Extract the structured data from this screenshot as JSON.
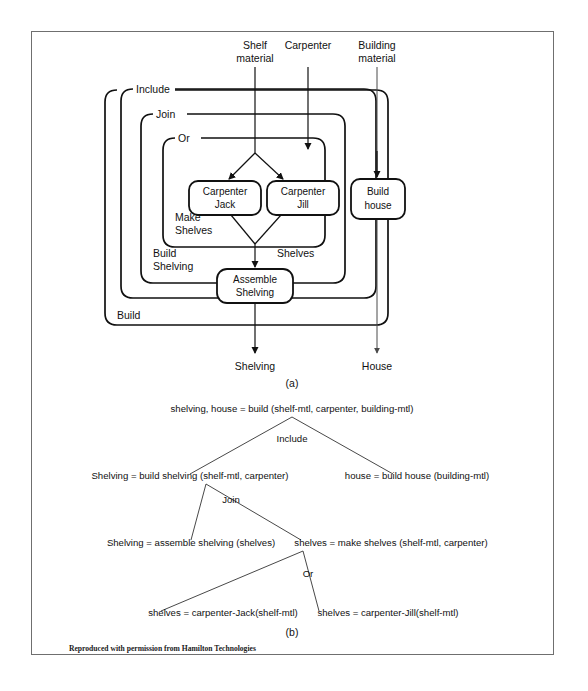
{
  "figure": {
    "credit": "Reproduced with permission from Hamilton Technologies",
    "part_a_caption": "(a)",
    "part_b_caption": "(b)"
  },
  "diagram_a": {
    "title": "FMap control structure decomposition",
    "inputs": [
      {
        "id": "shelf-material",
        "label_line1": "Shelf",
        "label_line2": "material"
      },
      {
        "id": "carpenter",
        "label_line1": "Carpenter",
        "label_line2": ""
      },
      {
        "id": "building-material",
        "label_line1": "Building",
        "label_line2": "material"
      }
    ],
    "containers": [
      {
        "id": "build",
        "label": "Build",
        "label_pos": "bottom-left"
      },
      {
        "id": "include",
        "label": "Include",
        "label_pos": "top-left"
      },
      {
        "id": "build-shelving",
        "label_line1": "Build",
        "label_line2": "Shelving",
        "label_pos": "bottom-left"
      },
      {
        "id": "join",
        "label": "Join",
        "label_pos": "top-left"
      },
      {
        "id": "make-shelves",
        "label_line1": "Make",
        "label_line2": "Shelves",
        "label_pos": "bottom-left"
      },
      {
        "id": "or",
        "label": "Or",
        "label_pos": "top-left"
      }
    ],
    "boxes": [
      {
        "id": "carpenter-jack",
        "line1": "Carpenter",
        "line2": "Jack"
      },
      {
        "id": "carpenter-jill",
        "line1": "Carpenter",
        "line2": "Jill"
      },
      {
        "id": "assemble-shelving",
        "line1": "Assemble",
        "line2": "Shelving"
      },
      {
        "id": "build-house",
        "line1": "Build",
        "line2": "house"
      }
    ],
    "intermediate_labels": [
      {
        "id": "shelves",
        "label": "Shelves"
      }
    ],
    "outputs": [
      {
        "id": "shelving",
        "label": "Shelving"
      },
      {
        "id": "house",
        "label": "House"
      }
    ]
  },
  "diagram_b": {
    "title": "FMap functional decomposition tree",
    "nodes": [
      {
        "id": "root",
        "text": "shelving, house = build (shelf-mtl, carpenter, building-mtl)"
      },
      {
        "id": "build-shelving",
        "text": "Shelving = build shelving (shelf-mtl, carpenter)"
      },
      {
        "id": "build-house",
        "text": "house = build house (building-mtl)"
      },
      {
        "id": "assemble-shelving",
        "text": "Shelving = assemble shelving (shelves)"
      },
      {
        "id": "make-shelves",
        "text": "shelves = make shelves (shelf-mtl, carpenter)"
      },
      {
        "id": "carpenter-jack",
        "text": "shelves = carpenter-Jack(shelf-mtl)"
      },
      {
        "id": "carpenter-jill",
        "text": "shelves = carpenter-Jill(shelf-mtl)"
      }
    ],
    "operators": [
      {
        "id": "include",
        "label": "Include"
      },
      {
        "id": "join",
        "label": "Join"
      },
      {
        "id": "or",
        "label": "Or"
      }
    ]
  },
  "colors": {
    "page_background": "#ffffff",
    "frame_stroke": "#6f6f6f",
    "ink": "#111111",
    "flow_line": "#333333"
  }
}
